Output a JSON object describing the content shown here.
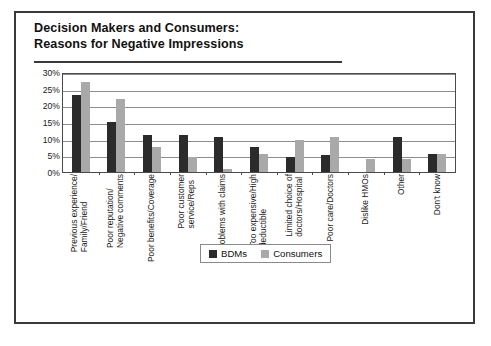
{
  "figure": {
    "title_line1": "Decision Makers and Consumers:",
    "title_line2": "Reasons for Negative Impressions"
  },
  "chart_data": {
    "type": "bar",
    "title": "Decision Makers and Consumers: Reasons for Negative Impressions",
    "xlabel": "",
    "ylabel": "",
    "ylim": [
      0,
      30
    ],
    "yticks": [
      "0%",
      "5%",
      "10%",
      "15%",
      "20%",
      "25%",
      "30%"
    ],
    "ytick_values": [
      0,
      5,
      10,
      15,
      20,
      25,
      30
    ],
    "grid": true,
    "legend_position": "bottom-center",
    "categories": [
      "Previous experience/ Family/Friend",
      "Poor reputation/ Negative comments",
      "Poor benefits/Coverage",
      "Poor customer service/Reps",
      "Problems with claims",
      "Too expensive/High deductible",
      "Limited choice of doctors/Hospital",
      "Poor care/Doctors",
      "Dislike HMOs",
      "Other",
      "Don't know"
    ],
    "category_lines": [
      [
        "Previous experience/",
        "Family/Friend"
      ],
      [
        "Poor reputation/",
        "Negative comments"
      ],
      [
        "Poor benefits/Coverage"
      ],
      [
        "Poor customer",
        "service/Reps"
      ],
      [
        "Problems with claims"
      ],
      [
        "Too expensive/High",
        "deductible"
      ],
      [
        "Limited choice of",
        "doctors/Hospital"
      ],
      [
        "Poor care/Doctors"
      ],
      [
        "Dislike HMOs"
      ],
      [
        "Other"
      ],
      [
        "Don't know"
      ]
    ],
    "series": [
      {
        "name": "BDMs",
        "color": "#2b2b2b",
        "values": [
          23,
          15,
          11,
          11,
          10.5,
          7.5,
          4.5,
          5,
          0,
          10.5,
          5.5
        ]
      },
      {
        "name": "Consumers",
        "color": "#a9a9a9",
        "values": [
          27,
          22,
          7.5,
          4.5,
          1,
          5.5,
          9.5,
          10.5,
          4,
          4,
          5.5
        ]
      }
    ]
  },
  "legend": {
    "items": [
      {
        "label": "BDMs",
        "color": "#2b2b2b"
      },
      {
        "label": "Consumers",
        "color": "#a9a9a9"
      }
    ]
  }
}
